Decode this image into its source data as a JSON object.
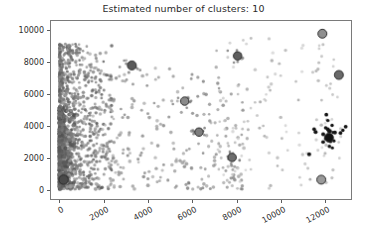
{
  "chart_data": {
    "type": "scatter",
    "title": "Estimated number of clusters: 10",
    "xlabel": "",
    "ylabel": "",
    "xlim": [
      -420,
      13200
    ],
    "ylim": [
      -620,
      10600
    ],
    "xticks": [
      0,
      2000,
      4000,
      6000,
      8000,
      10000,
      12000
    ],
    "yticks": [
      0,
      2000,
      4000,
      6000,
      8000,
      10000
    ],
    "xticklabels": [
      "0",
      "2000",
      "4000",
      "6000",
      "8000",
      "10000",
      "12000"
    ],
    "yticklabels": [
      "0",
      "2000",
      "4000",
      "6000",
      "8000",
      "10000"
    ],
    "grid": false,
    "legend": null,
    "n_clusters": 10,
    "colors": {
      "frame": "#7a7a7a",
      "text": "#2a2a2a",
      "background": "#ffffff",
      "cluster_dark": "#1a1a1a",
      "cluster_mid": "#6b6b6b",
      "cluster_light": "#b8b8b8"
    },
    "cluster_centers": [
      {
        "id": 0,
        "x": 150,
        "y": 600,
        "color": "#4a4a4a",
        "size": 9.5
      },
      {
        "id": 1,
        "x": 3250,
        "y": 7800,
        "color": "#5a5a5a",
        "size": 9.0
      },
      {
        "id": 2,
        "x": 5650,
        "y": 5550,
        "color": "#8a8a8a",
        "size": 8.5
      },
      {
        "id": 3,
        "x": 8050,
        "y": 8400,
        "color": "#5f5f5f",
        "size": 8.5
      },
      {
        "id": 4,
        "x": 6300,
        "y": 3600,
        "color": "#7d7d7d",
        "size": 8.5
      },
      {
        "id": 5,
        "x": 7800,
        "y": 2000,
        "color": "#6d6d6d",
        "size": 8.5
      },
      {
        "id": 6,
        "x": 11900,
        "y": 9800,
        "color": "#8f8f8f",
        "size": 9.0
      },
      {
        "id": 7,
        "x": 12650,
        "y": 7200,
        "color": "#6a6a6a",
        "size": 9.0
      },
      {
        "id": 8,
        "x": 12200,
        "y": 3250,
        "color": "#111111",
        "size": 9.0
      },
      {
        "id": 9,
        "x": 11850,
        "y": 600,
        "color": "#9a9a9a",
        "size": 9.0
      }
    ],
    "point_groups": [
      {
        "name": "dense-left-band",
        "color": "#6f6f6f",
        "count": 760
      },
      {
        "name": "mid-scatter",
        "color": "#8c8c8c",
        "count": 300
      },
      {
        "name": "sparse-right",
        "color": "#a9a9a9",
        "count": 120
      },
      {
        "name": "black-right-knot",
        "color": "#141414",
        "count": 18
      }
    ]
  }
}
